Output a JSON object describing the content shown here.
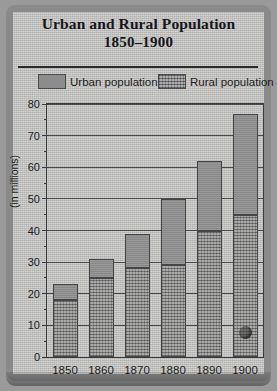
{
  "chart_data": {
    "type": "bar",
    "subtype": "stacked-vertical",
    "title": "Urban and Rural Population",
    "subtitle": "1850–1900",
    "xlabel": "",
    "ylabel": "(in millions)",
    "categories": [
      "1850",
      "1860",
      "1870",
      "1880",
      "1890",
      "1900"
    ],
    "series": [
      {
        "name": "Rural population",
        "values": [
          18,
          25,
          28,
          29,
          40,
          45
        ]
      },
      {
        "name": "Urban population",
        "values": [
          5,
          6,
          11,
          21,
          22,
          32
        ]
      }
    ],
    "totals": [
      23,
      31,
      39,
      50,
      62,
      77
    ],
    "ylim": [
      0,
      80
    ],
    "yticks": [
      0,
      10,
      20,
      30,
      40,
      50,
      60,
      70,
      80
    ],
    "ytick_labels": [
      "0",
      "10",
      "20",
      "30",
      "40",
      "50",
      "60",
      "70",
      "80"
    ],
    "yminor_step": 5,
    "grid": true,
    "legend_position": "top",
    "legend": [
      "Urban population",
      "Rural population"
    ]
  },
  "colors": {
    "paper": "#c3c3c2",
    "frame": "#8a8a8a",
    "axis": "#3b3b3e",
    "grid": "#4a4a4d",
    "urban": "#909090",
    "rural": "#8f8f8e",
    "text": "#1d1d20"
  }
}
